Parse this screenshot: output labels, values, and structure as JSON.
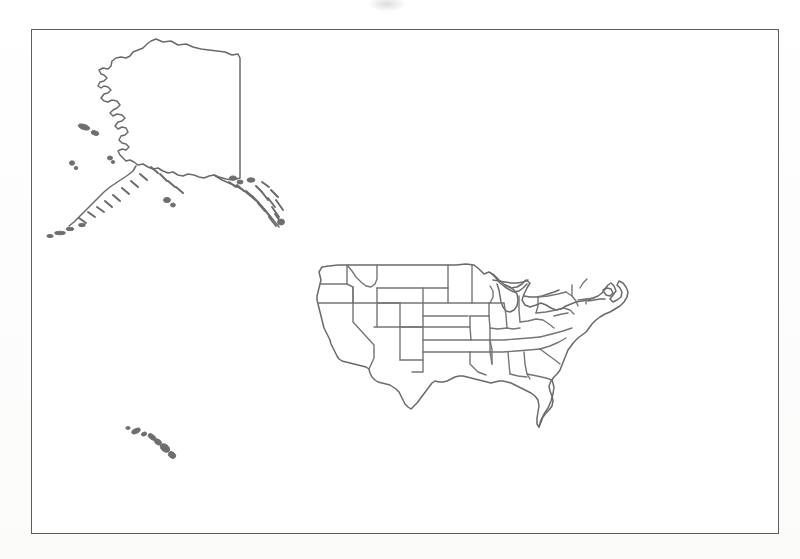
{
  "figure": {
    "kind": "scanned-map-figure",
    "title": "",
    "caption": "",
    "background_color": "#ffffff",
    "frame": {
      "present": true,
      "color": "#5d5d5d",
      "x": 31,
      "y": 29,
      "width": 748,
      "height": 505
    },
    "ink_color": "#6a6a6a",
    "boundary_color": "#757575"
  },
  "map": {
    "subject": "United States",
    "projection_note": "insets: Alaska upper-left, Hawaii lower-left, contiguous states center-right",
    "regions": [
      {
        "name": "Alaska",
        "role": "inset",
        "position": "upper-left",
        "features": [
          "mainland",
          "Aleutian Islands",
          "Southeast Alaska panhandle",
          "Kodiak Island",
          "Pribilof Islands"
        ],
        "internal_boundaries": false
      },
      {
        "name": "Contiguous United States",
        "role": "main",
        "position": "center-right",
        "features": [
          "state boundaries",
          "Great Lakes",
          "Florida peninsula",
          "Texas",
          "Cape Cod",
          "Long Island"
        ],
        "internal_boundaries": true,
        "state_count": 48
      },
      {
        "name": "Hawaii",
        "role": "inset",
        "position": "lower-left",
        "features": [
          "island chain"
        ],
        "internal_boundaries": false
      }
    ],
    "labels": [],
    "legend": {
      "present": false,
      "entries": []
    },
    "scale_bar": {
      "present": false
    },
    "north_arrow": {
      "present": false
    },
    "graticule": {
      "present": false
    }
  }
}
